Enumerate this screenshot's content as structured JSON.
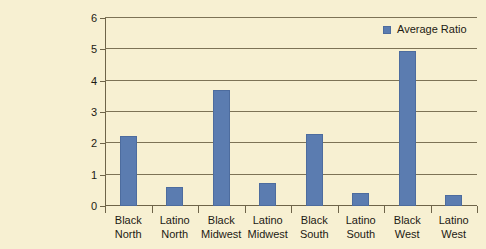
{
  "chart_data": {
    "type": "bar",
    "title": "",
    "subtitle": "",
    "xlabel": "",
    "ylabel": "",
    "ylim": [
      0,
      6
    ],
    "ytick_labels": [
      "0",
      "1",
      "2",
      "3",
      "4",
      "5",
      "6"
    ],
    "grid": true,
    "legend_position": "top-right",
    "categories": [
      "Black North",
      "Latino North",
      "Black Midwest",
      "Latino Midwest",
      "Black South",
      "Latino South",
      "Black West",
      "Latino West"
    ],
    "category_lines": [
      [
        "Black",
        "North"
      ],
      [
        "Latino",
        "North"
      ],
      [
        "Black",
        "Midwest"
      ],
      [
        "Latino",
        "Midwest"
      ],
      [
        "Black",
        "South"
      ],
      [
        "Latino",
        "South"
      ],
      [
        "Black",
        "West"
      ],
      [
        "Latino",
        "West"
      ]
    ],
    "series": [
      {
        "name": "Average Ratio",
        "color": "#5b7cb0",
        "values": [
          2.25,
          0.62,
          3.7,
          0.72,
          2.3,
          0.4,
          4.95,
          0.35
        ]
      }
    ]
  },
  "legend": {
    "entries": [
      {
        "label": "Average Ratio",
        "color": "#5b7cb0"
      }
    ]
  },
  "colors": {
    "background": "#f7f0d2",
    "bar": "#5b7cb0",
    "bar_border": "#4d6c9e",
    "axis": "#6e6449",
    "gridline": "#7d7356",
    "text": "#1d1a12"
  }
}
